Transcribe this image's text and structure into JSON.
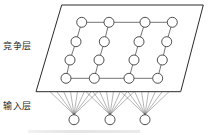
{
  "diagram": {
    "title": "",
    "labels": {
      "competition_layer": "竞争层",
      "input_layer": "输入层"
    },
    "colors": {
      "line": "#3a3a3a",
      "node_stroke": "#3a3a3a",
      "node_fill": "#ffffff",
      "plane_stroke": "#2a2a2a"
    },
    "plane": {
      "corners": [
        [
          61.7,
          5
        ],
        [
          203.3,
          5
        ],
        [
          180.7,
          91.7
        ],
        [
          36,
          91.7
        ]
      ]
    },
    "competition_nodes": {
      "rows": 4,
      "cols": 4,
      "radius": 5,
      "grid": [
        [
          [
            81.7,
            22.3
          ],
          [
            109,
            22.3
          ],
          [
            145,
            22.3
          ],
          [
            172.3,
            22.3
          ]
        ],
        [
          [
            76,
            41.7
          ],
          [
            104.3,
            41.7
          ],
          [
            139,
            41.7
          ],
          [
            166.7,
            41.7
          ]
        ],
        [
          [
            70,
            60
          ],
          [
            99,
            60
          ],
          [
            134,
            60
          ],
          [
            162.3,
            60
          ]
        ],
        [
          [
            66,
            78.3
          ],
          [
            94.3,
            78.3
          ],
          [
            129,
            78.3
          ],
          [
            157.7,
            78.3
          ]
        ]
      ],
      "connections": "top and bottom rows connected horizontally; each column connected vertically"
    },
    "input_nodes": {
      "radius": 5,
      "positions": [
        [
          74,
          119.7
        ],
        [
          110,
          119.7
        ],
        [
          145,
          119.7
        ]
      ],
      "fan_lines_per_node": 8,
      "fan_half_width": 24,
      "fan_top_y": 91.7
    }
  }
}
